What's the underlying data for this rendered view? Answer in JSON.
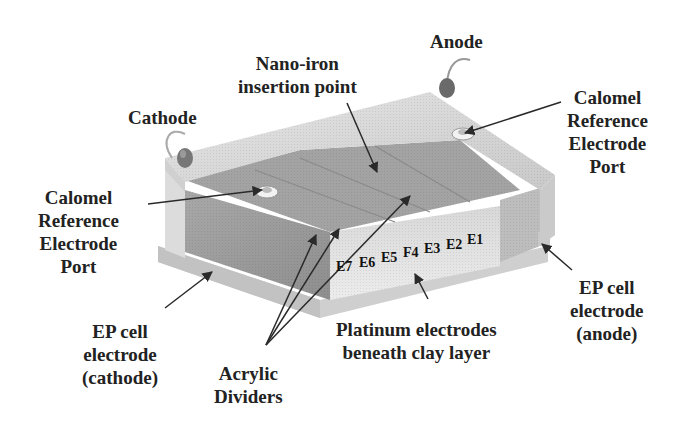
{
  "figure": {
    "labels": {
      "anode": "Anode",
      "cathode": "Cathode",
      "nano_iron": {
        "line1": "Nano-iron",
        "line2": "insertion point"
      },
      "calomel_left": {
        "line1": "Calomel",
        "line2": "Reference",
        "line3": "Electrode",
        "line4": "Port"
      },
      "calomel_right": {
        "line1": "Calomel",
        "line2": "Reference",
        "line3": "Electrode",
        "line4": "Port"
      },
      "ep_cathode": {
        "line1": "EP cell",
        "line2": "electrode",
        "line3": "(cathode)"
      },
      "ep_anode": {
        "line1": "EP cell",
        "line2": "electrode",
        "line3": "(anode)"
      },
      "acrylic": {
        "line1": "Acrylic",
        "line2": "Dividers"
      },
      "platinum": {
        "line1": "Platinum electrodes",
        "line2": "beneath clay layer"
      }
    },
    "electrodes": [
      "E7",
      "E6",
      "E5",
      "F4",
      "E3",
      "E2",
      "E1"
    ],
    "colors": {
      "lid": "#d9d9d9",
      "lid_edge": "#c4c4c4",
      "clay_top": "#9a9a9a",
      "clay_front": "#8c8c8c",
      "right_face": "#bdbdbd",
      "light_face": "#d2d2d2",
      "terminal": "#6e6e6e",
      "arrow": "#2a2a2a"
    }
  }
}
